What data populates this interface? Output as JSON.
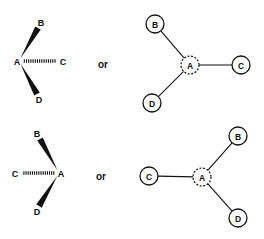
{
  "diagram": {
    "colors": {
      "ink": "#111111",
      "background": "#ffffff"
    },
    "connector": "or",
    "rows": [
      {
        "stereo": {
          "center": {
            "label": "A",
            "x": 19,
            "y": 61
          },
          "bonds": [
            {
              "label": "B",
              "type": "wedge",
              "tip": [
                38,
                28
              ],
              "labelPos": [
                41,
                23
              ]
            },
            {
              "label": "C",
              "type": "hash",
              "tip": [
                58,
                61
              ],
              "labelPos": [
                63,
                62
              ]
            },
            {
              "label": "D",
              "type": "wedge",
              "tip": [
                37,
                94
              ],
              "labelPos": [
                39,
                100
              ]
            }
          ]
        },
        "or_label": {
          "text": "or",
          "x": 103,
          "y": 64
        },
        "graph": {
          "center": {
            "label": "A",
            "x": 190,
            "y": 65,
            "style": "dashed"
          },
          "nodes": [
            {
              "label": "B",
              "x": 155,
              "y": 24
            },
            {
              "label": "C",
              "x": 241,
              "y": 65
            },
            {
              "label": "D",
              "x": 152,
              "y": 103
            }
          ]
        }
      },
      {
        "stereo": {
          "center": {
            "label": "A",
            "x": 59,
            "y": 173
          },
          "bonds": [
            {
              "label": "B",
              "type": "wedge",
              "tip": [
                40,
                139
              ],
              "labelPos": [
                37,
                134
              ]
            },
            {
              "label": "C",
              "type": "hash",
              "tip": [
                21,
                173
              ],
              "labelPos": [
                15,
                174
              ]
            },
            {
              "label": "D",
              "type": "wedge",
              "tip": [
                39,
                206
              ],
              "labelPos": [
                37,
                212
              ]
            }
          ]
        },
        "or_label": {
          "text": "or",
          "x": 101,
          "y": 176
        },
        "graph": {
          "center": {
            "label": "A",
            "x": 202,
            "y": 177,
            "style": "dashed"
          },
          "nodes": [
            {
              "label": "B",
              "x": 238,
              "y": 136
            },
            {
              "label": "C",
              "x": 149,
              "y": 176
            },
            {
              "label": "D",
              "x": 238,
              "y": 218
            }
          ]
        }
      }
    ]
  }
}
